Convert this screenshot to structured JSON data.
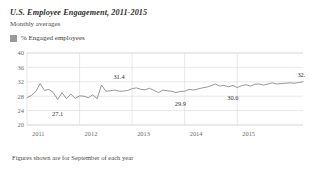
{
  "header": {
    "title": "U.S. Employee Engagement, 2011-2015",
    "subtitle": "Monthly averages"
  },
  "legend": {
    "swatch_icon": "legend-swatch-icon",
    "label": "% Engaged employees",
    "color": "#9a9a9a"
  },
  "footnote": "Figures shown are for September of each year",
  "chart_data": {
    "type": "line",
    "title": "U.S. Employee Engagement, 2011-2015",
    "subtitle": "Monthly averages",
    "xlabel": "",
    "ylabel": "",
    "ylim": [
      20,
      40
    ],
    "yticks": [
      20,
      24,
      28,
      32,
      36,
      40
    ],
    "ytick_labels": [
      "20",
      "24",
      "28",
      "32",
      "36",
      "40"
    ],
    "xticks": [
      2011,
      2012,
      2013,
      2014,
      2015
    ],
    "xtick_labels": [
      "2011",
      "2012",
      "2013",
      "2014",
      "2015"
    ],
    "grid": true,
    "legend_position": "above-plot",
    "line_color": "#8c8c8c",
    "series": [
      {
        "name": "% Engaged employees",
        "values": [
          27.6,
          28.2,
          29.3,
          31.5,
          29.6,
          29.9,
          29.0,
          27.1,
          29.0,
          27.3,
          28.6,
          27.4,
          28.1,
          28.0,
          27.6,
          28.4,
          27.3,
          31.1,
          29.4,
          29.5,
          29.7,
          29.4,
          29.4,
          29.6,
          30.1,
          30.3,
          29.9,
          29.8,
          30.2,
          29.6,
          29.0,
          29.7,
          29.5,
          29.4,
          29.0,
          29.3,
          29.4,
          29.9,
          29.7,
          30.0,
          30.3,
          30.5,
          30.9,
          31.4,
          30.8,
          31.0,
          30.6,
          31.0,
          30.4,
          30.9,
          31.2,
          30.8,
          31.3,
          31.4,
          31.1,
          31.4,
          31.7,
          31.4,
          31.5,
          31.6,
          31.7,
          31.6,
          31.8,
          32.0
        ]
      }
    ],
    "annotations": [
      {
        "label": "27.1",
        "x_index": 7,
        "value": 27.1
      },
      {
        "label": "31.4",
        "x_index": 21,
        "value": 31.1
      },
      {
        "label": "29.9",
        "x_index": 35,
        "value": 29.0
      },
      {
        "label": "30.6",
        "x_index": 47,
        "value": 30.6
      },
      {
        "label": "32.0",
        "x_index": 63,
        "value": 32.0
      }
    ]
  }
}
